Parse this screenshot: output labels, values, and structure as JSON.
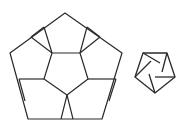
{
  "diagram": {
    "stroke_color": "#2a2a2a",
    "background": "#ffffff",
    "large_figure": {
      "name": "large pentagon subdivided into six pentagons",
      "outer": [
        [
          65,
          13
        ],
        [
          122,
          53
        ],
        [
          102,
          119
        ],
        [
          28,
          119
        ],
        [
          10,
          53
        ]
      ],
      "inner": [
        [
          52,
          53
        ],
        [
          80,
          53
        ],
        [
          88,
          79
        ],
        [
          67,
          95
        ],
        [
          44,
          79
        ]
      ],
      "spokes": [
        [
          [
            52,
            53
          ],
          [
            44,
            27
          ]
        ],
        [
          [
            80,
            53
          ],
          [
            87,
            27
          ]
        ],
        [
          [
            88,
            79
          ],
          [
            116,
            79
          ]
        ],
        [
          [
            67,
            95
          ],
          [
            61,
            119
          ]
        ],
        [
          [
            67,
            95
          ],
          [
            73,
            119
          ]
        ],
        [
          [
            44,
            79
          ],
          [
            19,
            79
          ]
        ],
        [
          [
            44,
            27
          ],
          [
            31,
            37
          ]
        ],
        [
          [
            87,
            27
          ],
          [
            100,
            37
          ]
        ],
        [
          [
            52,
            53
          ],
          [
            31,
            37
          ]
        ],
        [
          [
            80,
            53
          ],
          [
            100,
            37
          ]
        ],
        [
          [
            19,
            79
          ],
          [
            25,
            101
          ]
        ],
        [
          [
            116,
            79
          ],
          [
            109,
            101
          ]
        ]
      ]
    },
    "small_figure": {
      "name": "small pentagon pinwheel",
      "outer": [
        [
          143,
          53
        ],
        [
          167,
          53
        ],
        [
          175,
          77
        ],
        [
          155,
          93
        ],
        [
          135,
          77
        ]
      ],
      "pinwheel": [
        [
          [
            143,
            53
          ],
          [
            160,
            63
          ]
        ],
        [
          [
            167,
            53
          ],
          [
            162,
            72
          ]
        ],
        [
          [
            175,
            77
          ],
          [
            155,
            77
          ]
        ],
        [
          [
            155,
            93
          ],
          [
            149,
            74
          ]
        ],
        [
          [
            135,
            77
          ],
          [
            151,
            61
          ]
        ]
      ]
    }
  }
}
